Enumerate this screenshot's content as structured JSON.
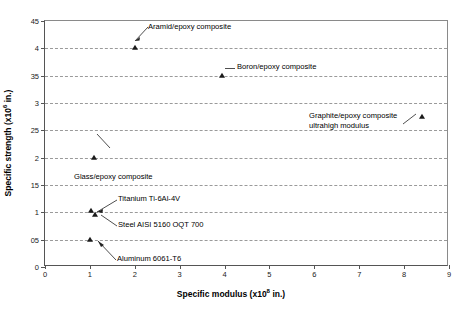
{
  "chart_data": {
    "type": "scatter",
    "title": "",
    "xlabel_text": "Specific modulus (x10",
    "xlabel_exp": "8",
    "xlabel_tail": " in.)",
    "ylabel_text": "Specific strength (x10",
    "ylabel_exp": "6",
    "ylabel_tail": " in.)",
    "xlim": [
      0,
      9
    ],
    "ylim": [
      0,
      4.5
    ],
    "xticks": [
      "0",
      "1",
      "2",
      "3",
      "4",
      "5",
      "6",
      "7",
      "8",
      "9"
    ],
    "xtick_values": [
      0,
      1,
      2,
      3,
      4,
      5,
      6,
      7,
      8,
      9
    ],
    "yticks": [
      "0",
      "05",
      "1",
      "15",
      "2",
      "25",
      "3",
      "35",
      "4",
      "45"
    ],
    "ytick_values": [
      0,
      0.5,
      1,
      1.5,
      2,
      2.5,
      3,
      3.5,
      4,
      4.5
    ],
    "grid": "horizontal-dashed",
    "legend": "none",
    "marker": "triangle",
    "marker_color": "#1a1a1a",
    "grid_color": "#9a9a9a",
    "axis_color": "#555555",
    "points": [
      {
        "label": "Aramid/epoxy composite",
        "x": 2.0,
        "y": 4.0
      },
      {
        "label": "Boron/epoxy composite",
        "x": 3.95,
        "y": 3.5
      },
      {
        "label": "Graphite/epoxy composite ultrahigh modulus",
        "x": 8.4,
        "y": 2.75
      },
      {
        "label": "Glass/epoxy composite",
        "x": 1.1,
        "y": 2.0
      },
      {
        "label": "Titanium Ti-6Al-4V",
        "x": 1.02,
        "y": 1.02
      },
      {
        "label": "Steel AISI 5160 OQT 700",
        "x": 1.12,
        "y": 0.95
      },
      {
        "label": "Aluminum 6061-T6",
        "x": 1.0,
        "y": 0.5
      }
    ]
  },
  "annotations": {
    "aramid": "Aramid/epoxy composite",
    "boron": "Boron/epoxy composite",
    "graphite_line1": "Graphite/epoxy composite",
    "graphite_line2": "ultrahigh modulus",
    "glass": "Glass/epoxy composite",
    "titanium": "Titanium Ti-6Al-4V",
    "steel": "Steel AISI 5160 OQT 700",
    "aluminum": "Aluminum 6061-T6"
  }
}
